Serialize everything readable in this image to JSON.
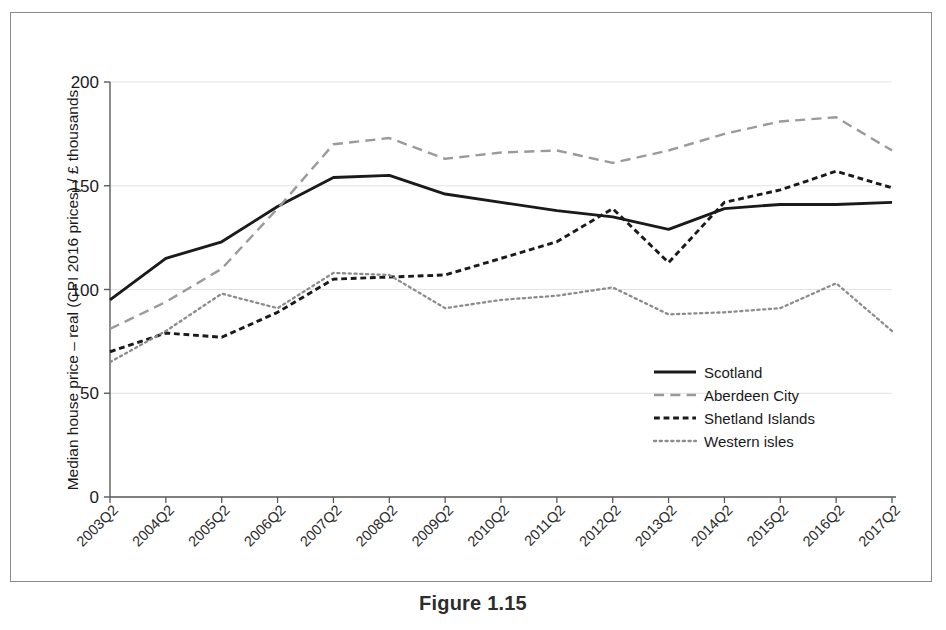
{
  "figure": {
    "caption": "Figure 1.15"
  },
  "colors": {
    "scotland": "#1a1a1a",
    "aberdeen_city": "#9a9a9a",
    "shetland_islands": "#1a1a1a",
    "western_isles": "#8c8c8c",
    "axis": "#5a5a5a",
    "grid": "#e2e2e8",
    "frame": "#8a8a8a",
    "text": "#1a1a1a"
  },
  "legend": {
    "position": "inside-right-lower",
    "entries": [
      {
        "label": "Scotland",
        "style": "solid",
        "color": "#1a1a1a",
        "width": 2.6
      },
      {
        "label": "Aberdeen City",
        "style": "long-dash",
        "color": "#9a9a9a",
        "width": 2.2
      },
      {
        "label": "Shetland Islands",
        "style": "short-dash",
        "color": "#1a1a1a",
        "width": 2.6
      },
      {
        "label": "Western isles",
        "style": "dotted",
        "color": "#8c8c8c",
        "width": 2.0
      }
    ]
  },
  "chart_data": {
    "type": "line",
    "title": "",
    "xlabel": "",
    "ylabel": "Median house price – real (CPI 2016 prices) / £ thousands",
    "grid": true,
    "xlim": [
      "2003Q2",
      "2017Q2"
    ],
    "ylim": [
      0,
      200
    ],
    "yticks": [
      0,
      50,
      100,
      150,
      200
    ],
    "ytick_labels": [
      "0",
      "50",
      "100",
      "150",
      "200"
    ],
    "categories": [
      "2003Q2",
      "2004Q2",
      "2005Q2",
      "2006Q2",
      "2007Q2",
      "2008Q2",
      "2009Q2",
      "2010Q2",
      "2011Q2",
      "2012Q2",
      "2013Q2",
      "2014Q2",
      "2015Q2",
      "2016Q2",
      "2017Q2"
    ],
    "series": [
      {
        "name": "Scotland",
        "style": "solid",
        "color": "#1a1a1a",
        "values": [
          95,
          115,
          123,
          140,
          154,
          155,
          146,
          142,
          138,
          135,
          129,
          139,
          141,
          141,
          142
        ]
      },
      {
        "name": "Aberdeen City",
        "style": "long-dash",
        "color": "#9a9a9a",
        "values": [
          81,
          94,
          110,
          139,
          170,
          173,
          163,
          166,
          167,
          161,
          167,
          175,
          181,
          183,
          167
        ]
      },
      {
        "name": "Shetland Islands",
        "style": "short-dash",
        "color": "#1a1a1a",
        "values": [
          70,
          79,
          77,
          89,
          105,
          106,
          107,
          115,
          123,
          139,
          113,
          142,
          148,
          157,
          149
        ]
      },
      {
        "name": "Western isles",
        "style": "dotted",
        "color": "#8c8c8c",
        "values": [
          65,
          80,
          98,
          91,
          108,
          107,
          91,
          95,
          97,
          101,
          88,
          89,
          91,
          103,
          80
        ]
      }
    ]
  }
}
